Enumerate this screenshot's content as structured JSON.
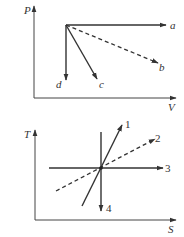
{
  "diagrams": [
    {
      "name": "PV diagram",
      "axes": {
        "x_label": "V",
        "y_label": "P"
      },
      "origin_point": [
        66,
        25
      ],
      "processes": [
        {
          "label": "a",
          "style": "solid",
          "direction": "horizontal right (isobaric)"
        },
        {
          "label": "b",
          "style": "dashed",
          "direction": "down-right"
        },
        {
          "label": "c",
          "style": "solid",
          "direction": "steep down-right"
        },
        {
          "label": "d",
          "style": "solid",
          "direction": "vertical down (isochoric)"
        }
      ]
    },
    {
      "name": "TS diagram",
      "axes": {
        "x_label": "S",
        "y_label": "T"
      },
      "processes": [
        {
          "label": "1",
          "style": "solid",
          "direction": "steep up-right"
        },
        {
          "label": "2",
          "style": "dashed",
          "direction": "gentle up-right"
        },
        {
          "label": "3",
          "style": "solid",
          "direction": "horizontal right (isothermal)"
        },
        {
          "label": "4",
          "style": "solid",
          "direction": "vertical down (isentropic)"
        }
      ]
    }
  ],
  "labels": {
    "pv": {
      "y": "P",
      "x": "V",
      "a": "a",
      "b": "b",
      "c": "c",
      "d": "d"
    },
    "ts": {
      "y": "T",
      "x": "S",
      "p1": "1",
      "p2": "2",
      "p3": "3",
      "p4": "4"
    }
  },
  "colors": {
    "line": "#333333",
    "background": "#ffffff"
  }
}
